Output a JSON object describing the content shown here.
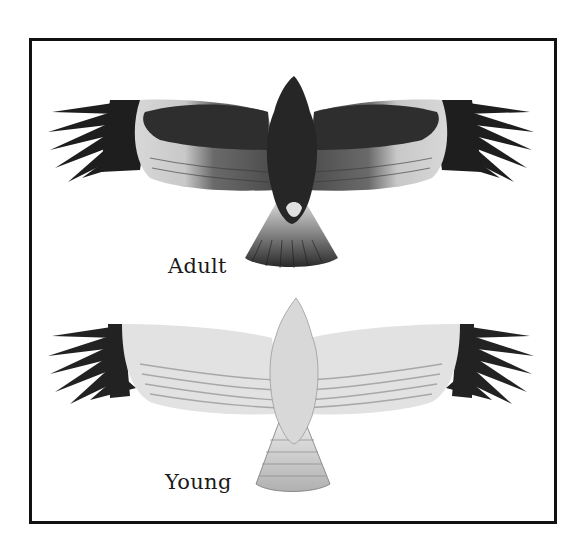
{
  "figure": {
    "panels": [
      {
        "id": "adult",
        "caption": "Adult",
        "description": "Dark bird in flight seen from below, pale wing patches near the tips and a barred fan tail"
      },
      {
        "id": "young",
        "caption": "Young",
        "description": "Pale bird in flight seen from below, barred wings with dark tips and a barred tail"
      }
    ]
  },
  "colors": {
    "frame": "#111111",
    "adult_dark": "#2a2a2a",
    "adult_mid": "#5a5a5a",
    "adult_pale": "#e6e6e6",
    "young_body": "#dcdcdc",
    "young_bars": "#9a9a9a",
    "wingtip": "#1e1e1e"
  }
}
